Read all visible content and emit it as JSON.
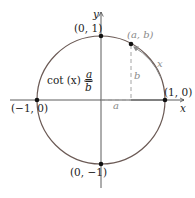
{
  "diagram": {
    "axes": {
      "x_label": "x",
      "y_label": "y"
    },
    "points": [
      {
        "label": "(0, 1)",
        "name": "top"
      },
      {
        "label": "(1, 0)",
        "name": "right"
      },
      {
        "label": "(-1, 0)",
        "name": "left"
      },
      {
        "label": "(0, -1)",
        "name": "bottom"
      },
      {
        "label": "(a, b)",
        "name": "terminal"
      }
    ],
    "point_labels": {
      "top": "(0, 1)",
      "right": "(1, 0)",
      "left": "(−1, 0)",
      "bottom": "(0, −1)",
      "terminal": "(a, b)"
    },
    "segment_labels": {
      "horizontal": "a",
      "vertical": "b",
      "arc": "x"
    },
    "formula": {
      "lhs": "cot (x) =",
      "numerator": "a",
      "denominator": "b"
    },
    "colors": {
      "circle": "#6b5a55",
      "axes": "#4a4a4a",
      "dashed": "#9a9a9a",
      "arc_arrow": "#8a8a8a",
      "points": "#111111",
      "gray_text": "#8a8a8a"
    }
  }
}
